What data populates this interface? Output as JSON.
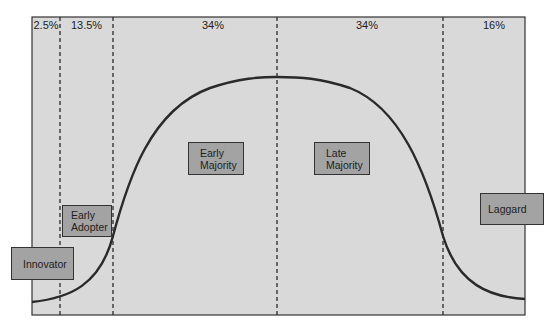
{
  "diagram": {
    "colors": {
      "background": "#d9d9d9",
      "box_fill": "#a3a3a3",
      "line": "#2a2a2a"
    },
    "segments": [
      {
        "percent": "2.5%"
      },
      {
        "percent": "13.5%"
      },
      {
        "percent": "34%"
      },
      {
        "percent": "34%"
      },
      {
        "percent": "16%"
      }
    ],
    "categories": [
      {
        "line1": "Innovator",
        "line2": ""
      },
      {
        "line1": "Early",
        "line2": "Adopter"
      },
      {
        "line1": "Early",
        "line2": "Majority"
      },
      {
        "line1": "Late",
        "line2": "Majority"
      },
      {
        "line1": "Laggard",
        "line2": ""
      }
    ]
  }
}
